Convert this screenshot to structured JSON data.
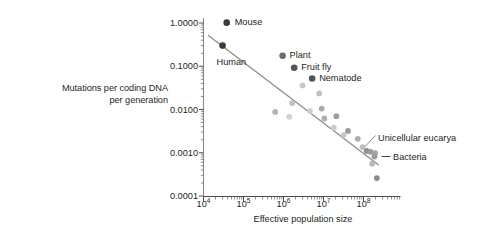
{
  "chart_data": {
    "type": "scatter",
    "title": "",
    "xlabel": "Effective population size",
    "ylabel": "Mutations per coding DNA per generation",
    "xscale": "log",
    "yscale": "log",
    "xlim": [
      10000,
      400000000
    ],
    "ylim": [
      0.0001,
      1.0
    ],
    "grid": false,
    "legend": "none",
    "x_ticklabels": [
      "10⁴",
      "10⁵",
      "10⁶",
      "10⁷",
      "10⁸"
    ],
    "x_tickvalues": [
      10000,
      100000,
      1000000,
      10000000,
      100000000
    ],
    "y_ticklabels": [
      "1.0000",
      "0.1000",
      "0.0100",
      "0.0010",
      "0.0001"
    ],
    "y_tickvalues": [
      1.0,
      0.1,
      0.01,
      0.001,
      0.0001
    ],
    "minor_ticks": true,
    "trendline": {
      "label": "",
      "x_start": 13000,
      "y_start": 0.52,
      "x_end": 240000000,
      "y_end": 0.00052,
      "color": "#8c8c8c"
    },
    "labeled_points": [
      {
        "name": "Mouse",
        "x": 38000,
        "y": 1.02,
        "color": "#3a3a3a",
        "label_dx": 8,
        "label_dy": 0
      },
      {
        "name": "Human",
        "x": 30000,
        "y": 0.3,
        "color": "#3a3a3a",
        "label_dx": -6,
        "label_dy": 17
      },
      {
        "name": "Plant",
        "x": 950000,
        "y": 0.175,
        "color": "#6b6b6b",
        "label_dx": 7,
        "label_dy": 0
      },
      {
        "name": "Fruit fly",
        "x": 1850000,
        "y": 0.092,
        "color": "#555555",
        "label_dx": 7,
        "label_dy": 0
      },
      {
        "name": "Nematode",
        "x": 5200000,
        "y": 0.052,
        "color": "#555555",
        "label_dx": 7,
        "label_dy": 0
      }
    ],
    "unlabeled_points": [
      {
        "x": 3000000,
        "y": 0.036,
        "color": "#c9c9c9"
      },
      {
        "x": 7800000,
        "y": 0.0235,
        "color": "#c0c0c0"
      },
      {
        "x": 1650000,
        "y": 0.014,
        "color": "#c2c2c2"
      },
      {
        "x": 4600000,
        "y": 0.0092,
        "color": "#cfcfcf"
      },
      {
        "x": 620000,
        "y": 0.0088,
        "color": "#b5b5b5"
      },
      {
        "x": 1400000,
        "y": 0.0068,
        "color": "#d2d2d2"
      },
      {
        "x": 10500000,
        "y": 0.0062,
        "color": "#b0b0b0"
      },
      {
        "x": 9000000,
        "y": 0.0105,
        "color": "#a8a8a8"
      },
      {
        "x": 21000000,
        "y": 0.007,
        "color": "#9d9d9d"
      },
      {
        "x": 18000000,
        "y": 0.0038,
        "color": "#cccccc"
      },
      {
        "x": 41000000,
        "y": 0.0032,
        "color": "#9a9a9a"
      },
      {
        "x": 32000000,
        "y": 0.0026,
        "color": "#c7c7c7"
      },
      {
        "x": 72000000,
        "y": 0.0021,
        "color": "#adadad"
      },
      {
        "x": 95000000,
        "y": 0.00135,
        "color": "#bdbdbd"
      },
      {
        "x": 120000000,
        "y": 0.0011,
        "color": "#8f8f8f"
      },
      {
        "x": 150000000,
        "y": 0.00105,
        "color": "#9b9b9b"
      },
      {
        "x": 195000000,
        "y": 0.00098,
        "color": "#a4a4a4"
      },
      {
        "x": 215000000,
        "y": 0.00026,
        "color": "#8a8a8a"
      },
      {
        "x": 165000000,
        "y": 0.00056,
        "color": "#b8b8b8"
      }
    ],
    "annotations": [
      {
        "text": "Unicellular eucarya",
        "x_px": 378,
        "y_px": 138,
        "leader": true
      },
      {
        "text": "Bacteria",
        "x_px": 393,
        "y_px": 157,
        "leader": false,
        "dash": true
      }
    ]
  },
  "axis_titles": {
    "y": "Mutations per coding DNA",
    "y2": "per generation",
    "x": "Effective population size"
  }
}
